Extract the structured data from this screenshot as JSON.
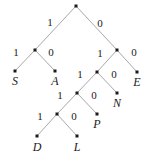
{
  "figure": {
    "kind": "huffman-code-tree",
    "width": 151,
    "height": 162,
    "background": "#ffffff",
    "edge_color": "#a8a8a8",
    "node_color": "#1a1a1a",
    "text_color": "#1a1a1a"
  },
  "nodes": [
    {
      "id": "root",
      "x": 76,
      "y": 6,
      "type": "internal"
    },
    {
      "id": "n_1",
      "x": 35,
      "y": 50,
      "type": "internal"
    },
    {
      "id": "n_0",
      "x": 117,
      "y": 50,
      "type": "internal"
    },
    {
      "id": "n_01",
      "x": 97,
      "y": 72,
      "type": "internal"
    },
    {
      "id": "n_011",
      "x": 77,
      "y": 93,
      "type": "internal"
    },
    {
      "id": "n_0111",
      "x": 57,
      "y": 114,
      "type": "internal"
    },
    {
      "id": "leaf_S",
      "x": 15,
      "y": 71,
      "type": "leaf"
    },
    {
      "id": "leaf_A",
      "x": 55,
      "y": 71,
      "type": "leaf"
    },
    {
      "id": "leaf_E",
      "x": 137,
      "y": 72,
      "type": "leaf"
    },
    {
      "id": "leaf_N",
      "x": 117,
      "y": 93,
      "type": "leaf"
    },
    {
      "id": "leaf_P",
      "x": 97,
      "y": 114,
      "type": "leaf"
    },
    {
      "id": "leaf_D",
      "x": 37,
      "y": 136,
      "type": "leaf"
    },
    {
      "id": "leaf_L",
      "x": 77,
      "y": 136,
      "type": "leaf"
    }
  ],
  "edges": [
    {
      "from": "root",
      "to": "n_1",
      "bit": "1",
      "x1": 76,
      "y1": 6,
      "x2": 35,
      "y2": 50
    },
    {
      "from": "root",
      "to": "n_0",
      "bit": "0",
      "x1": 76,
      "y1": 6,
      "x2": 117,
      "y2": 50
    },
    {
      "from": "n_1",
      "to": "leaf_S",
      "bit": "1",
      "x1": 35,
      "y1": 50,
      "x2": 15,
      "y2": 71
    },
    {
      "from": "n_1",
      "to": "leaf_A",
      "bit": "0",
      "x1": 35,
      "y1": 50,
      "x2": 55,
      "y2": 71
    },
    {
      "from": "n_0",
      "to": "n_01",
      "bit": "1",
      "x1": 117,
      "y1": 50,
      "x2": 97,
      "y2": 72
    },
    {
      "from": "n_0",
      "to": "leaf_E",
      "bit": "0",
      "x1": 117,
      "y1": 50,
      "x2": 137,
      "y2": 72
    },
    {
      "from": "n_01",
      "to": "n_011",
      "bit": "1",
      "x1": 97,
      "y1": 72,
      "x2": 77,
      "y2": 93
    },
    {
      "from": "n_01",
      "to": "leaf_N",
      "bit": "0",
      "x1": 97,
      "y1": 72,
      "x2": 117,
      "y2": 93
    },
    {
      "from": "n_011",
      "to": "n_0111",
      "bit": "1",
      "x1": 77,
      "y1": 93,
      "x2": 57,
      "y2": 114
    },
    {
      "from": "n_011",
      "to": "leaf_P",
      "bit": "0",
      "x1": 77,
      "y1": 93,
      "x2": 97,
      "y2": 114
    },
    {
      "from": "n_0111",
      "to": "leaf_D",
      "bit": "1",
      "x1": 57,
      "y1": 114,
      "x2": 37,
      "y2": 136
    },
    {
      "from": "n_0111",
      "to": "leaf_L",
      "bit": "0",
      "x1": 57,
      "y1": 114,
      "x2": 77,
      "y2": 136
    }
  ],
  "edge_labels": [
    {
      "text": "1",
      "x": 50,
      "y": 22
    },
    {
      "text": "0",
      "x": 100,
      "y": 23
    },
    {
      "text": "1",
      "x": 16,
      "y": 52
    },
    {
      "text": "0",
      "x": 51,
      "y": 52
    },
    {
      "text": "1",
      "x": 100,
      "y": 53
    },
    {
      "text": "0",
      "x": 134,
      "y": 52
    },
    {
      "text": "1",
      "x": 80,
      "y": 74
    },
    {
      "text": "0",
      "x": 114,
      "y": 74
    },
    {
      "text": "1",
      "x": 60,
      "y": 95
    },
    {
      "text": "0",
      "x": 94,
      "y": 95
    },
    {
      "text": "1",
      "x": 40,
      "y": 116
    },
    {
      "text": "0",
      "x": 74,
      "y": 116
    }
  ],
  "leaf_labels": [
    {
      "text": "S",
      "x": 15,
      "y": 81,
      "code": "11"
    },
    {
      "text": "A",
      "x": 55,
      "y": 81,
      "code": "10"
    },
    {
      "text": "E",
      "x": 137,
      "y": 82,
      "code": "00"
    },
    {
      "text": "N",
      "x": 117,
      "y": 103,
      "code": "010"
    },
    {
      "text": "P",
      "x": 97,
      "y": 124,
      "code": "0110"
    },
    {
      "text": "D",
      "x": 37,
      "y": 147,
      "code": "01111"
    },
    {
      "text": "L",
      "x": 77,
      "y": 147,
      "code": "01110"
    }
  ]
}
